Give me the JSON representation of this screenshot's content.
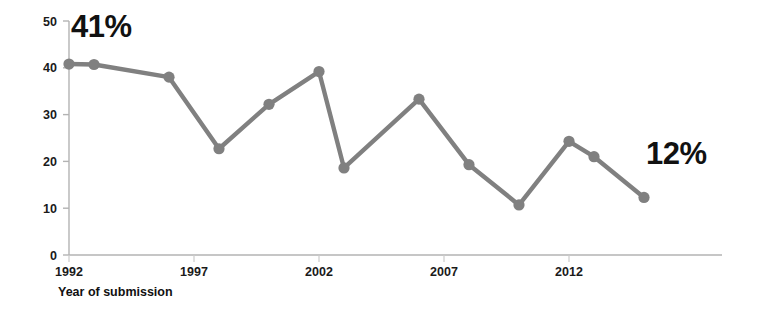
{
  "chart_data": {
    "type": "line",
    "title": "",
    "subtitle": "",
    "xlabel": "Year of submission",
    "ylabel": "",
    "xlim": [
      1991,
      2016
    ],
    "ylim": [
      0,
      50
    ],
    "grid": false,
    "legend": null,
    "x": [
      1992,
      1993,
      1996,
      1998,
      2000,
      2002,
      2003,
      2006,
      2008,
      2010,
      2012,
      2013,
      2015
    ],
    "categories": [
      "1992",
      "1993",
      "1996",
      "1998",
      "2000",
      "2002",
      "2003",
      "2006",
      "2008",
      "2010",
      "2012",
      "2013",
      "2015"
    ],
    "values": [
      40.8,
      40.7,
      38.0,
      22.7,
      32.2,
      39.2,
      18.6,
      33.3,
      19.3,
      10.7,
      24.3,
      21.0,
      12.3
    ],
    "series": [
      {
        "name": "Percentage",
        "color": "#808080",
        "values": [
          40.8,
          40.7,
          38.0,
          22.7,
          32.2,
          39.2,
          18.6,
          33.3,
          19.3,
          10.7,
          24.3,
          21.0,
          12.3
        ]
      }
    ],
    "x_ticks": [
      1992,
      1997,
      2002,
      2007,
      2012
    ],
    "x_tick_labels": [
      "1992",
      "1997",
      "2002",
      "2007",
      "2012"
    ],
    "y_ticks": [
      0,
      10,
      20,
      30,
      40,
      50
    ],
    "y_tick_labels": [
      "0",
      "10",
      "20",
      "30",
      "40",
      "50"
    ],
    "annotations": [
      {
        "text": "41%",
        "x": 1992,
        "y": 46.5,
        "align": "start"
      },
      {
        "text": "12%",
        "x": 2015,
        "y": 19.5,
        "align": "start"
      }
    ],
    "colors": {
      "line": "#808080",
      "marker": "#808080",
      "axis": "#b3b3b3",
      "text": "#111111"
    }
  }
}
